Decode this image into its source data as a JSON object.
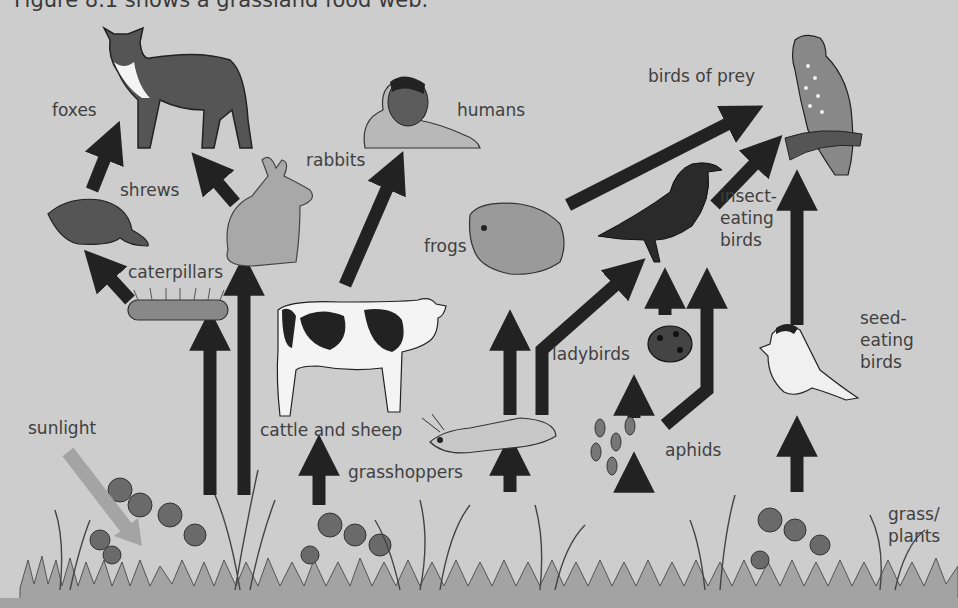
{
  "caption": "Figure 8.1 shows a grassland food web.",
  "colors": {
    "background": "#cdcdcd",
    "arrow": "#222222",
    "sunlight_arrow": "#a4a4a4",
    "ground": "#a3a3a3",
    "label_text": "#404040"
  },
  "labels": {
    "foxes": "foxes",
    "humans": "humans",
    "birds_of_prey": "birds of prey",
    "shrews": "shrews",
    "rabbits": "rabbits",
    "frogs": "frogs",
    "insect_eating_birds_1": "insect-",
    "insect_eating_birds_2": "eating",
    "insect_eating_birds_3": "birds",
    "caterpillars": "caterpillars",
    "seed_eating_birds_1": "seed-",
    "seed_eating_birds_2": "eating",
    "seed_eating_birds_3": "birds",
    "ladybirds": "ladybirds",
    "sunlight": "sunlight",
    "cattle_and_sheep": "cattle and sheep",
    "grasshoppers": "grasshoppers",
    "aphids": "aphids",
    "grass_plants_1": "grass/",
    "grass_plants_2": "plants"
  },
  "food_web": {
    "nodes": [
      "sunlight",
      "grass/plants",
      "caterpillars",
      "rabbits",
      "cattle and sheep",
      "grasshoppers",
      "aphids",
      "shrews",
      "foxes",
      "humans",
      "frogs",
      "ladybirds",
      "insect-eating birds",
      "seed-eating birds",
      "birds of prey"
    ],
    "links": [
      {
        "from": "sunlight",
        "to": "grass/plants"
      },
      {
        "from": "grass/plants",
        "to": "caterpillars"
      },
      {
        "from": "grass/plants",
        "to": "rabbits"
      },
      {
        "from": "grass/plants",
        "to": "cattle and sheep"
      },
      {
        "from": "grass/plants",
        "to": "grasshoppers"
      },
      {
        "from": "grass/plants",
        "to": "aphids"
      },
      {
        "from": "grass/plants",
        "to": "seed-eating birds"
      },
      {
        "from": "caterpillars",
        "to": "shrews"
      },
      {
        "from": "shrews",
        "to": "foxes"
      },
      {
        "from": "rabbits",
        "to": "foxes"
      },
      {
        "from": "cattle and sheep",
        "to": "humans"
      },
      {
        "from": "grasshoppers",
        "to": "frogs"
      },
      {
        "from": "grasshoppers",
        "to": "insect-eating birds"
      },
      {
        "from": "aphids",
        "to": "ladybirds"
      },
      {
        "from": "aphids",
        "to": "insect-eating birds"
      },
      {
        "from": "ladybirds",
        "to": "insect-eating birds"
      },
      {
        "from": "frogs",
        "to": "birds of prey"
      },
      {
        "from": "insect-eating birds",
        "to": "birds of prey"
      },
      {
        "from": "seed-eating birds",
        "to": "birds of prey"
      }
    ]
  }
}
